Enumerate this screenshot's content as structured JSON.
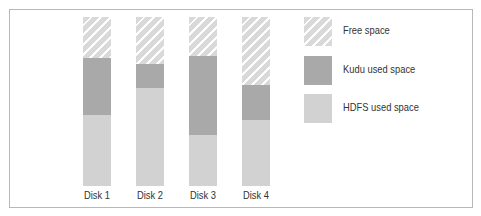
{
  "chart_data": {
    "type": "bar",
    "stacked": true,
    "normalized": true,
    "title": "",
    "xlabel": "",
    "ylabel": "",
    "categories": [
      "Disk 1",
      "Disk 2",
      "Disk 3",
      "Disk 4"
    ],
    "series": [
      {
        "name": "HDFS used space",
        "values": [
          42,
          58,
          30,
          39
        ],
        "color": "#d2d2d2",
        "pattern": "solid"
      },
      {
        "name": "Kudu used space",
        "values": [
          34,
          14,
          47,
          21
        ],
        "color": "#a9a9a9",
        "pattern": "solid"
      },
      {
        "name": "Free space",
        "values": [
          24,
          28,
          23,
          40
        ],
        "color": "#d9d9d9",
        "pattern": "diagonal-hatch"
      }
    ],
    "ylim": [
      0,
      100
    ],
    "grid": false,
    "legend_position": "right"
  },
  "legend": {
    "items": [
      {
        "label": "Free space"
      },
      {
        "label": "Kudu used space"
      },
      {
        "label": "HDFS used space"
      }
    ]
  },
  "xaxis": {
    "labels": [
      "Disk 1",
      "Disk 2",
      "Disk 3",
      "Disk 4"
    ]
  }
}
